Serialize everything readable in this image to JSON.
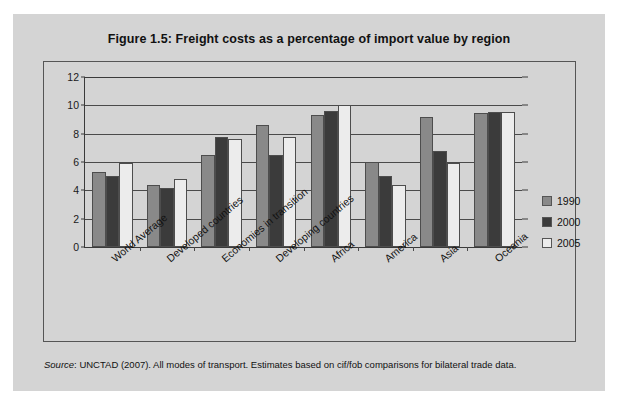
{
  "figure": {
    "title": "Figure 1.5:  Freight costs as a percentage of import value by region",
    "source_word": "Source",
    "source_text": ": UNCTAD (2007). All modes of transport. Estimates based on cif/fob comparisons for bilateral trade data."
  },
  "legend": {
    "position": "right",
    "entries": [
      {
        "label": "1990",
        "color": "#898989"
      },
      {
        "label": "2000",
        "color": "#3b3b3b"
      },
      {
        "label": "2005",
        "color": "#ececec"
      }
    ]
  },
  "chart_data": {
    "type": "bar",
    "title": "Figure 1.5:  Freight costs as a percentage of import value by region",
    "xlabel": "",
    "ylabel": "",
    "ylim": [
      0,
      12
    ],
    "yticks": [
      0,
      2,
      4,
      6,
      8,
      10,
      12
    ],
    "grid": true,
    "legend_position": "right",
    "categories": [
      "World Average",
      "Developed countries",
      "Economies in transition",
      "Developing countries",
      "Africa",
      "America",
      "Asia",
      "Oceania"
    ],
    "series": [
      {
        "name": "1990",
        "color": "#898989",
        "values": [
          5.3,
          4.35,
          6.5,
          8.6,
          9.35,
          6.0,
          9.2,
          9.45
        ]
      },
      {
        "name": "2000",
        "color": "#3b3b3b",
        "values": [
          5.0,
          4.2,
          7.75,
          6.5,
          9.6,
          5.0,
          6.8,
          9.5
        ]
      },
      {
        "name": "2005",
        "color": "#ececec",
        "values": [
          5.9,
          4.8,
          7.6,
          7.75,
          10.0,
          4.35,
          5.9,
          9.55
        ]
      }
    ]
  }
}
